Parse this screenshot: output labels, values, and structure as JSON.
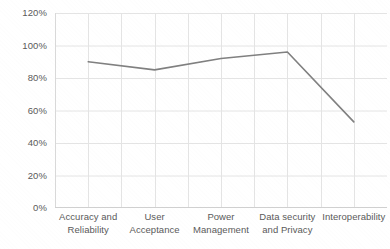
{
  "chart_data": {
    "type": "line",
    "title": "",
    "xlabel": "",
    "ylabel": "",
    "categories": [
      "Accuracy and Reliability",
      "User Acceptance",
      "Power Management",
      "Data security and Privacy",
      "Interoperability"
    ],
    "category_lines": [
      [
        "Accuracy and",
        "Reliability"
      ],
      [
        "User Acceptance",
        ""
      ],
      [
        "Power",
        "Management"
      ],
      [
        "Data security",
        "and Privacy"
      ],
      [
        "Interoperability",
        ""
      ]
    ],
    "values": [
      90,
      85,
      92,
      96,
      53
    ],
    "value_labels": [
      "90%",
      "85%",
      "92%",
      "96%",
      "53%"
    ],
    "ylim": [
      0,
      120
    ],
    "ytick_values": [
      0,
      20,
      40,
      60,
      80,
      100,
      120
    ],
    "ytick_labels": [
      "0%",
      "20%",
      "40%",
      "60%",
      "80%",
      "100%",
      "120%"
    ],
    "grid": {
      "horizontal": true,
      "vertical": true,
      "color": "#e4e4e4"
    },
    "legend": {
      "visible": false,
      "position": "none",
      "entries": []
    },
    "series": [
      {
        "name": "Series 1",
        "color": "#808080",
        "line_width": 1.6,
        "markers": false,
        "values": [
          90,
          85,
          92,
          96,
          53
        ]
      }
    ],
    "colors": {
      "line": "#808080",
      "axis_text": "#5a5a5a",
      "grid": "#e4e4e4",
      "plot_background": "#ffffff",
      "page_background": "#ffffff"
    }
  }
}
